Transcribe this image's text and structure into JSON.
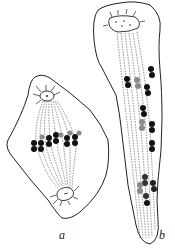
{
  "figure": {
    "panels": [
      {
        "id": "a",
        "label": "a",
        "description": "Cell with metaphase spindle and chromosome plate"
      },
      {
        "id": "b",
        "label": "b",
        "description": "Elongated cell with spindle fibers and scattered chromosomes"
      }
    ],
    "colors": {
      "outline": "#222222",
      "chromosome_dark": "#111111",
      "chromosome_light": "#8a8a8a",
      "background": "#ffffff"
    }
  }
}
